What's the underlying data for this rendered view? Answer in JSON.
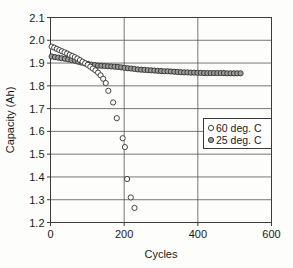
{
  "chart_data": {
    "type": "scatter",
    "title": "",
    "xlabel": "Cycles",
    "ylabel": "Capacity (Ah)",
    "xlim": [
      0,
      600
    ],
    "ylim": [
      1.2,
      2.1
    ],
    "xticks": [
      0,
      200,
      400,
      600
    ],
    "yticks": [
      1.2,
      1.3,
      1.4,
      1.5,
      1.6,
      1.7,
      1.8,
      1.9,
      2.0,
      2.1
    ],
    "xtick_labels": [
      "0",
      "200",
      "400",
      "600"
    ],
    "ytick_labels": [
      "1.2",
      "1.3",
      "1.4",
      "1.5",
      "1.6",
      "1.7",
      "1.8",
      "1.9",
      "2.0",
      "2.1"
    ],
    "grid": "horizontal-and-vertical",
    "legend_position": "center-right",
    "series": [
      {
        "name": "60 deg. C",
        "marker": "open-circle",
        "marker_color": "#ffffff",
        "edge_color": "#2e2e2e",
        "points": [
          [
            3,
            1.972
          ],
          [
            10,
            1.968
          ],
          [
            17,
            1.962
          ],
          [
            24,
            1.957
          ],
          [
            31,
            1.952
          ],
          [
            38,
            1.947
          ],
          [
            45,
            1.942
          ],
          [
            52,
            1.936
          ],
          [
            59,
            1.931
          ],
          [
            66,
            1.926
          ],
          [
            73,
            1.92
          ],
          [
            80,
            1.913
          ],
          [
            87,
            1.906
          ],
          [
            94,
            1.899
          ],
          [
            101,
            1.892
          ],
          [
            108,
            1.884
          ],
          [
            115,
            1.876
          ],
          [
            122,
            1.868
          ],
          [
            129,
            1.858
          ],
          [
            136,
            1.846
          ],
          [
            143,
            1.831
          ],
          [
            150,
            1.812
          ],
          [
            157,
            1.778
          ],
          [
            170,
            1.727
          ],
          [
            180,
            1.658
          ],
          [
            196,
            1.57
          ],
          [
            202,
            1.531
          ],
          [
            208,
            1.391
          ],
          [
            218,
            1.31
          ],
          [
            228,
            1.264
          ]
        ]
      },
      {
        "name": "25 deg. C",
        "marker": "filled-circle",
        "marker_color": "#9a9a9a",
        "edge_color": "#2e2e2e",
        "points": [
          [
            3,
            1.929
          ],
          [
            12,
            1.926
          ],
          [
            21,
            1.924
          ],
          [
            30,
            1.921
          ],
          [
            39,
            1.919
          ],
          [
            48,
            1.916
          ],
          [
            57,
            1.913
          ],
          [
            66,
            1.91
          ],
          [
            75,
            1.906
          ],
          [
            84,
            1.902
          ],
          [
            93,
            1.899
          ],
          [
            102,
            1.896
          ],
          [
            111,
            1.893
          ],
          [
            120,
            1.891
          ],
          [
            129,
            1.889
          ],
          [
            138,
            1.888
          ],
          [
            147,
            1.887
          ],
          [
            156,
            1.886
          ],
          [
            165,
            1.885
          ],
          [
            174,
            1.884
          ],
          [
            183,
            1.883
          ],
          [
            192,
            1.881
          ],
          [
            201,
            1.879
          ],
          [
            210,
            1.877
          ],
          [
            219,
            1.876
          ],
          [
            228,
            1.874
          ],
          [
            237,
            1.872
          ],
          [
            246,
            1.871
          ],
          [
            255,
            1.87
          ],
          [
            264,
            1.869
          ],
          [
            273,
            1.868
          ],
          [
            282,
            1.867
          ],
          [
            291,
            1.866
          ],
          [
            300,
            1.865
          ],
          [
            309,
            1.864
          ],
          [
            318,
            1.864
          ],
          [
            327,
            1.863
          ],
          [
            336,
            1.862
          ],
          [
            345,
            1.861
          ],
          [
            354,
            1.86
          ],
          [
            363,
            1.859
          ],
          [
            372,
            1.859
          ],
          [
            381,
            1.858
          ],
          [
            390,
            1.858
          ],
          [
            399,
            1.857
          ],
          [
            408,
            1.857
          ],
          [
            417,
            1.856
          ],
          [
            426,
            1.856
          ],
          [
            435,
            1.856
          ],
          [
            444,
            1.856
          ],
          [
            453,
            1.856
          ],
          [
            462,
            1.856
          ],
          [
            471,
            1.856
          ],
          [
            480,
            1.855
          ],
          [
            489,
            1.855
          ],
          [
            498,
            1.855
          ],
          [
            507,
            1.855
          ],
          [
            516,
            1.855
          ]
        ]
      }
    ]
  },
  "legend": {
    "entries": [
      {
        "label": "60 deg. C",
        "marker": "open-circle"
      },
      {
        "label": "25 deg. C",
        "marker": "filled-circle"
      }
    ]
  },
  "colors": {
    "frame": "#3b3b3b",
    "grid": "#555555",
    "text": "#1a1a1a",
    "marker_fill_25c": "#9a9a9a",
    "marker_fill_60c": "#ffffff",
    "background": "#fdfdfc"
  }
}
